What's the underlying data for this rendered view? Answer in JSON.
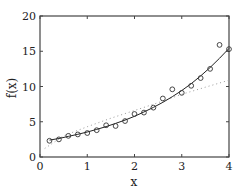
{
  "chart_data": {
    "type": "scatter",
    "title": "",
    "xlabel": "x",
    "ylabel": "f(x)",
    "xlim": [
      0,
      4
    ],
    "ylim": [
      0,
      20
    ],
    "xticks": [
      0,
      1,
      2,
      3,
      4
    ],
    "yticks": [
      0,
      5,
      10,
      15,
      20
    ],
    "grid": false,
    "legend": null,
    "series": [
      {
        "name": "data",
        "style": "markers-open-circle",
        "x": [
          0.2,
          0.4,
          0.6,
          0.8,
          1.0,
          1.2,
          1.4,
          1.6,
          1.8,
          2.0,
          2.2,
          2.4,
          2.6,
          2.8,
          3.0,
          3.2,
          3.4,
          3.6,
          3.8,
          4.0
        ],
        "y": [
          2.3,
          2.5,
          3.0,
          3.2,
          3.4,
          3.8,
          4.5,
          4.4,
          5.1,
          6.1,
          6.3,
          7.0,
          8.3,
          9.6,
          9.1,
          10.1,
          11.2,
          12.5,
          15.9,
          15.3
        ]
      },
      {
        "name": "exponential fit",
        "style": "solid-line",
        "x": [
          0.2,
          0.4,
          0.6,
          0.8,
          1.0,
          1.2,
          1.4,
          1.6,
          1.8,
          2.0,
          2.2,
          2.4,
          2.6,
          2.8,
          3.0,
          3.2,
          3.4,
          3.6,
          3.8,
          4.0
        ],
        "y": [
          2.4,
          2.63,
          2.92,
          3.22,
          3.54,
          3.91,
          4.31,
          4.76,
          5.24,
          5.78,
          6.38,
          7.03,
          7.76,
          8.56,
          9.43,
          10.4,
          11.5,
          12.7,
          14.0,
          15.4
        ]
      },
      {
        "name": "alternative fit",
        "style": "dotted-line",
        "x": [
          0.1,
          0.5,
          1.0,
          1.5,
          2.0,
          2.5,
          3.0,
          3.5,
          4.0
        ],
        "y": [
          1.2,
          3.0,
          4.3,
          5.5,
          6.6,
          7.7,
          8.9,
          9.9,
          10.9
        ]
      }
    ]
  },
  "labels": {
    "xlabel": "x",
    "ylabel": "f(x)"
  }
}
